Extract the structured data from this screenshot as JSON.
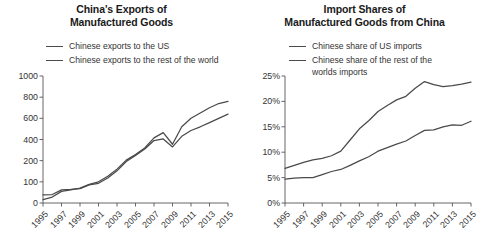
{
  "figure": {
    "width": 486,
    "height": 247,
    "background": "#ffffff",
    "line_color": "#4a4a4a",
    "axis_color": "#555555",
    "text_color": "#333333"
  },
  "panels": [
    {
      "id": "exports",
      "title": "China's Exports of\nManufactured Goods",
      "legend": [
        {
          "label": "Chinese exports to the US",
          "wrap": false
        },
        {
          "label": "Chinese exports to the rest of the world",
          "wrap": false
        }
      ],
      "chart_data": {
        "type": "line",
        "title": "China's Exports of Manufactured Goods",
        "xlabel": "",
        "ylabel": "",
        "scale": "nonlinear-sqrt",
        "yticks": [
          0,
          100,
          200,
          400,
          600,
          800,
          1000
        ],
        "yticklabels": [
          "0",
          "100",
          "200",
          "400",
          "600",
          "800",
          "1000"
        ],
        "ylim": [
          0,
          1000
        ],
        "xticks": [
          1995,
          1997,
          1999,
          2001,
          2003,
          2005,
          2007,
          2009,
          2011,
          2013,
          2015
        ],
        "xticklabels": [
          "1995",
          "1997",
          "1999",
          "2001",
          "2003",
          "2005",
          "2007",
          "2009",
          "2011",
          "2013",
          "2015"
        ],
        "xlim": [
          1995,
          2015
        ],
        "grid": false,
        "legend_position": "above-axes",
        "x": [
          1995,
          1996,
          1997,
          1998,
          1999,
          2000,
          2001,
          2002,
          2003,
          2004,
          2005,
          2006,
          2007,
          2008,
          2009,
          2010,
          2011,
          2012,
          2013,
          2014,
          2015
        ],
        "series": [
          {
            "name": "Chinese exports to the US",
            "values": [
              38,
              40,
              62,
              64,
              68,
              86,
              93,
              118,
              152,
              196,
              250,
              310,
              390,
              405,
              330,
              430,
              485,
              520,
              560,
              600,
              640
            ]
          },
          {
            "name": "Chinese exports to the rest of the world",
            "values": [
              16,
              28,
              55,
              62,
              70,
              88,
              100,
              126,
              160,
              205,
              258,
              320,
              415,
              465,
              355,
              520,
              600,
              650,
              700,
              740,
              760
            ]
          }
        ]
      }
    },
    {
      "id": "import-shares",
      "title": "Import Shares of\nManufactured Goods from China",
      "legend": [
        {
          "label": "Chinese share of US imports",
          "wrap": false
        },
        {
          "label": "Chinese share of the rest of the worlds imports",
          "wrap": true
        }
      ],
      "chart_data": {
        "type": "line",
        "title": "Import Shares of Manufactured Goods from China",
        "xlabel": "",
        "ylabel": "",
        "scale": "linear",
        "yticks": [
          0,
          5,
          10,
          15,
          20,
          25
        ],
        "yticklabels": [
          "0%",
          "5%",
          "10%",
          "15%",
          "20%",
          "25%"
        ],
        "ylim": [
          0,
          25
        ],
        "xticks": [
          1995,
          1997,
          1999,
          2001,
          2003,
          2005,
          2007,
          2009,
          2011,
          2013,
          2015
        ],
        "xticklabels": [
          "1995",
          "1997",
          "1999",
          "2001",
          "2003",
          "2005",
          "2007",
          "2009",
          "2011",
          "2013",
          "2015"
        ],
        "xlim": [
          1995,
          2015
        ],
        "grid": false,
        "legend_position": "above-axes",
        "x": [
          1995,
          1996,
          1997,
          1998,
          1999,
          2000,
          2001,
          2002,
          2003,
          2004,
          2005,
          2006,
          2007,
          2008,
          2009,
          2010,
          2011,
          2012,
          2013,
          2014,
          2015
        ],
        "series": [
          {
            "name": "Chinese share of US imports",
            "values": [
              6.8,
              7.4,
              8.0,
              8.5,
              8.8,
              9.3,
              10.2,
              12.4,
              14.6,
              16.2,
              18.0,
              19.2,
              20.3,
              21.0,
              22.6,
              23.9,
              23.3,
              22.9,
              23.1,
              23.4,
              23.8
            ]
          },
          {
            "name": "Chinese share of the rest of the worlds imports",
            "values": [
              4.7,
              4.9,
              5.0,
              5.0,
              5.6,
              6.2,
              6.6,
              7.4,
              8.3,
              9.1,
              10.2,
              10.9,
              11.6,
              12.2,
              13.3,
              14.3,
              14.4,
              15.0,
              15.4,
              15.3,
              16.1
            ]
          }
        ]
      }
    }
  ]
}
